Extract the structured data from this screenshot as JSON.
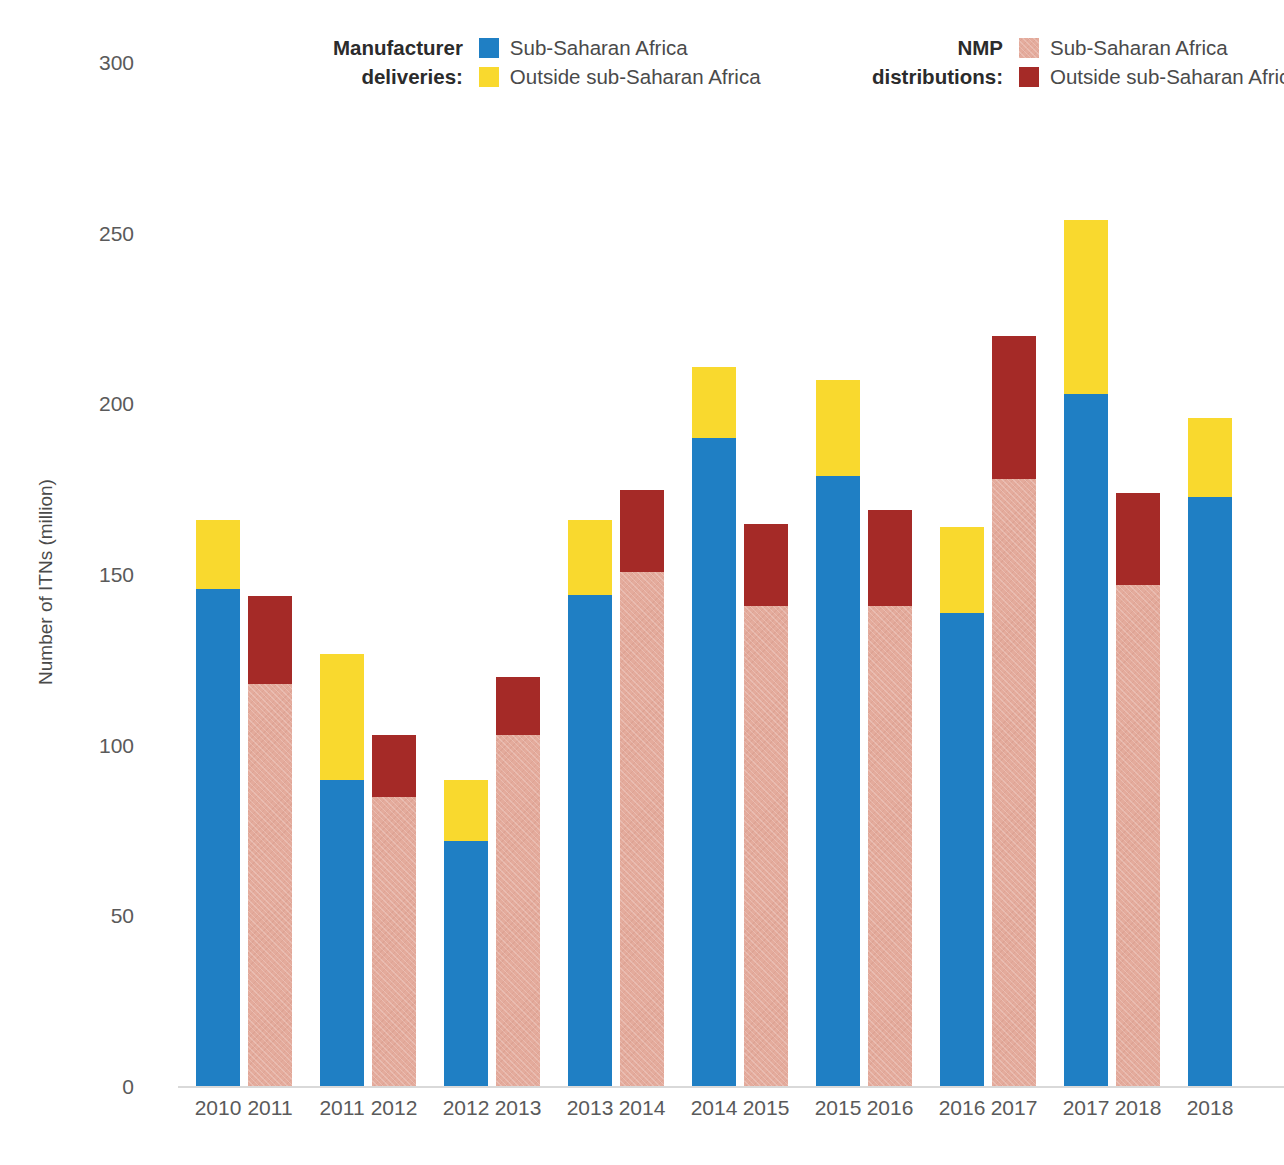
{
  "chart_data": {
    "type": "bar",
    "title": "",
    "subtitle": "",
    "xlabel": "",
    "ylabel": "Number of ITNs (million)",
    "ylim": [
      0,
      300
    ],
    "yticks": [
      0,
      50,
      100,
      150,
      200,
      250,
      300
    ],
    "ytick_labels": [
      "0",
      "50",
      "100",
      "150",
      "200",
      "250",
      "300"
    ],
    "grid": false,
    "legend_position": "top",
    "stacked": true,
    "colors": {
      "deliveries_ssa": "#1f7fc4",
      "deliveries_outside": "#f9d92e",
      "nmp_ssa": "#e4ab9c",
      "nmp_outside": "#a52a27"
    },
    "series": [
      {
        "name": "Manufacturer deliveries: Sub-Saharan Africa",
        "key": "deliveries_ssa"
      },
      {
        "name": "Manufacturer deliveries: Outside sub-Saharan Africa",
        "key": "deliveries_outside"
      },
      {
        "name": "NMP distributions: Sub-Saharan Africa",
        "key": "nmp_ssa"
      },
      {
        "name": "NMP distributions: Outside sub-Saharan Africa",
        "key": "nmp_outside"
      }
    ],
    "bars": [
      {
        "label": "2010",
        "kind": "deliveries",
        "ssa": 146,
        "outside": 20,
        "total": 166
      },
      {
        "label": "2011",
        "kind": "nmp",
        "ssa": 118,
        "outside": 26,
        "total": 144
      },
      {
        "label": "2011",
        "kind": "deliveries",
        "ssa": 90,
        "outside": 37,
        "total": 127
      },
      {
        "label": "2012",
        "kind": "nmp",
        "ssa": 85,
        "outside": 18,
        "total": 103
      },
      {
        "label": "2012",
        "kind": "deliveries",
        "ssa": 72,
        "outside": 18,
        "total": 90
      },
      {
        "label": "2013",
        "kind": "nmp",
        "ssa": 103,
        "outside": 17,
        "total": 120
      },
      {
        "label": "2013",
        "kind": "deliveries",
        "ssa": 144,
        "outside": 22,
        "total": 166
      },
      {
        "label": "2014",
        "kind": "nmp",
        "ssa": 151,
        "outside": 24,
        "total": 175
      },
      {
        "label": "2014",
        "kind": "deliveries",
        "ssa": 190,
        "outside": 21,
        "total": 211
      },
      {
        "label": "2015",
        "kind": "nmp",
        "ssa": 141,
        "outside": 24,
        "total": 165
      },
      {
        "label": "2015",
        "kind": "deliveries",
        "ssa": 179,
        "outside": 28,
        "total": 207
      },
      {
        "label": "2016",
        "kind": "nmp",
        "ssa": 141,
        "outside": 28,
        "total": 169
      },
      {
        "label": "2016",
        "kind": "deliveries",
        "ssa": 139,
        "outside": 25,
        "total": 164
      },
      {
        "label": "2017",
        "kind": "nmp",
        "ssa": 178,
        "outside": 42,
        "total": 220
      },
      {
        "label": "2017",
        "kind": "deliveries",
        "ssa": 203,
        "outside": 51,
        "total": 254
      },
      {
        "label": "2018",
        "kind": "nmp",
        "ssa": 147,
        "outside": 27,
        "total": 174
      },
      {
        "label": "2018",
        "kind": "deliveries",
        "ssa": 173,
        "outside": 23,
        "total": 196
      }
    ]
  },
  "legend": {
    "groups": [
      {
        "title": "Manufacturer\ndeliveries:",
        "entries": [
          {
            "label": "Sub-Saharan Africa",
            "color": "#1f7fc4",
            "style": "solid"
          },
          {
            "label": "Outside sub-Saharan Africa",
            "color": "#f9d92e",
            "style": "solid"
          }
        ]
      },
      {
        "title": "NMP\ndistributions:",
        "entries": [
          {
            "label": "Sub-Saharan Africa",
            "color": "#e4ab9c",
            "style": "hatched"
          },
          {
            "label": "Outside sub-Saharan Africa",
            "color": "#a52a27",
            "style": "solid"
          }
        ]
      }
    ]
  }
}
